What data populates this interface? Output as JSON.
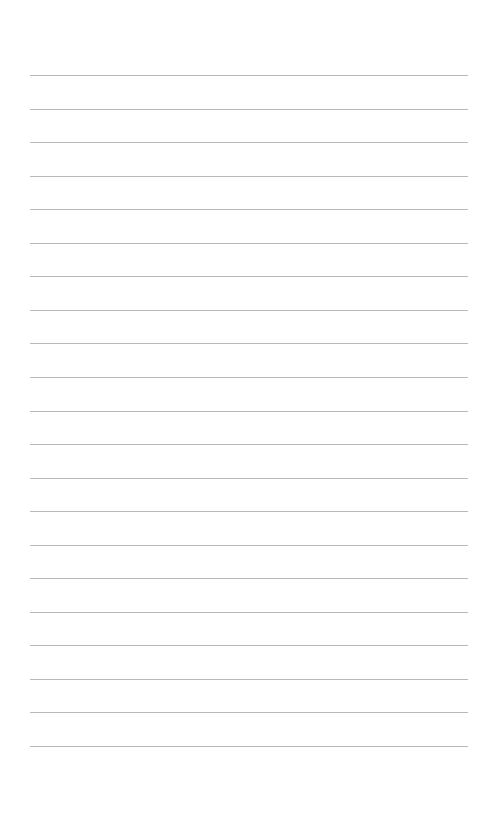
{
  "page": {
    "type": "lined-paper",
    "background_color": "#ffffff",
    "line_color": "#b8b8b8",
    "line_count": 21,
    "first_line_y": 75,
    "line_spacing": 33.55,
    "line_left": 30,
    "line_right": 468,
    "lines": [
      "",
      "",
      "",
      "",
      "",
      "",
      "",
      "",
      "",
      "",
      "",
      "",
      "",
      "",
      "",
      "",
      "",
      "",
      "",
      "",
      ""
    ]
  }
}
